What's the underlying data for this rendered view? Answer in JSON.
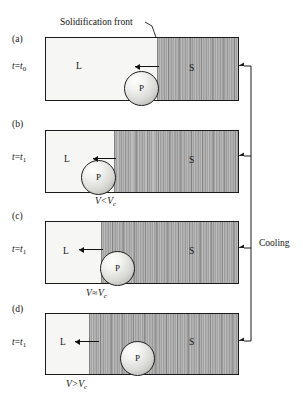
{
  "figure": {
    "front_annotation": "Solidification front",
    "cooling_label": "Cooling",
    "liquid_letter": "L",
    "solid_letter": "S",
    "particle_letter": "P",
    "colors": {
      "outline": "#1b1b1b",
      "liquid_fill": "#f6f6f4",
      "solid_fill": "#a8a8a8",
      "particle_fill": "#e8e8e4",
      "text": "#141414"
    }
  },
  "panels": [
    {
      "letter": "(a)",
      "time_var": "t",
      "time_eq": "=",
      "time_val": "t",
      "time_sub": "0",
      "liquid_letter": "L",
      "solid_letter": "S",
      "particle_letter": "P",
      "velocity": null,
      "velocity_op": null
    },
    {
      "letter": "(b)",
      "time_var": "t",
      "time_eq": "=",
      "time_val": "t",
      "time_sub": "1",
      "liquid_letter": "L",
      "solid_letter": "S",
      "particle_letter": "P",
      "velocity_lhs": "V",
      "velocity_op": "<",
      "velocity_rhs": "V",
      "velocity_sub": "c"
    },
    {
      "letter": "(c)",
      "time_var": "t",
      "time_eq": "=",
      "time_val": "t",
      "time_sub": "1",
      "liquid_letter": "L",
      "solid_letter": "S",
      "particle_letter": "P",
      "velocity_lhs": "V",
      "velocity_op": "≈",
      "velocity_rhs": "V",
      "velocity_sub": "c"
    },
    {
      "letter": "(d)",
      "time_var": "t",
      "time_eq": "=",
      "time_val": "t",
      "time_sub": "1",
      "liquid_letter": "L",
      "solid_letter": "S",
      "particle_letter": "P",
      "velocity_lhs": "V",
      "velocity_op": ">",
      "velocity_rhs": "V",
      "velocity_sub": "c"
    }
  ]
}
